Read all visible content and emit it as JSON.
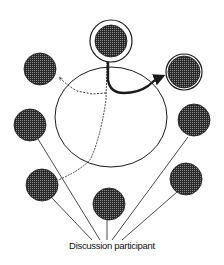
{
  "diagram": {
    "label": "Discussion participant",
    "colors": {
      "ink": "#1a1a1a",
      "fill": "#3a3a3a",
      "background": "#ffffff"
    },
    "central_space": {
      "cx": 111,
      "cy": 117,
      "rx": 56,
      "ry": 50
    },
    "participants": [
      {
        "id": "top",
        "cx": 111,
        "cy": 41,
        "r": 16,
        "ring": 21,
        "role": "speaker"
      },
      {
        "id": "right-top",
        "cx": 184,
        "cy": 72,
        "r": 17,
        "ring": 18,
        "role": "addressee"
      },
      {
        "id": "left-top",
        "cx": 40,
        "cy": 69,
        "r": 16
      },
      {
        "id": "left-middle",
        "cx": 30,
        "cy": 125,
        "r": 16
      },
      {
        "id": "right-middle",
        "cx": 194,
        "cy": 120,
        "r": 16
      },
      {
        "id": "left-bottom",
        "cx": 42,
        "cy": 185,
        "r": 16
      },
      {
        "id": "bottom-center",
        "cx": 109,
        "cy": 204,
        "r": 16
      },
      {
        "id": "right-bottom",
        "cx": 186,
        "cy": 179,
        "r": 16
      }
    ]
  }
}
